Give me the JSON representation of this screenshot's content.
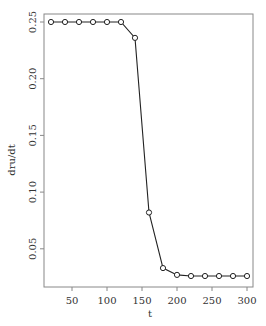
{
  "chart_data": {
    "type": "line",
    "title": "",
    "xlabel": "t",
    "ylabel": "dru/dt",
    "xlim": [
      13,
      308
    ],
    "ylim": [
      0.017,
      0.258
    ],
    "xticks": [
      50,
      100,
      150,
      200,
      250,
      300
    ],
    "yticks": [
      0.05,
      0.1,
      0.15,
      0.2,
      0.25
    ],
    "ytick_labels": [
      "0.05",
      "0.10",
      "0.15",
      "0.20",
      "0.25"
    ],
    "xtick_labels": [
      "50",
      "100",
      "150",
      "200",
      "250",
      "300"
    ],
    "grid": false,
    "legend": null,
    "marker": "open-circle",
    "series": [
      {
        "name": "dru/dt",
        "x": [
          20,
          40,
          60,
          80,
          100,
          120,
          140,
          160,
          180,
          200,
          220,
          240,
          260,
          280,
          300
        ],
        "values": [
          0.25,
          0.25,
          0.25,
          0.25,
          0.25,
          0.25,
          0.236,
          0.082,
          0.033,
          0.027,
          0.026,
          0.026,
          0.026,
          0.026,
          0.026
        ]
      }
    ]
  }
}
